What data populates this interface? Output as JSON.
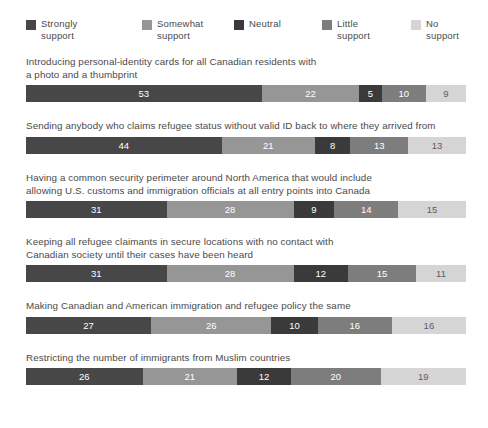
{
  "legend": {
    "items": [
      {
        "label": "Strongly\nsupport",
        "color": "#474747",
        "key": "strongly_support"
      },
      {
        "label": "Somewhat\nsupport",
        "color": "#969696",
        "key": "somewhat_support"
      },
      {
        "label": "Neutral",
        "color": "#3a3a3a",
        "key": "neutral"
      },
      {
        "label": "Little\nsupport",
        "color": "#7d7d7d",
        "key": "little_support"
      },
      {
        "label": "No support",
        "color": "#d5d5d5",
        "key": "no_support"
      }
    ]
  },
  "chart_data": {
    "type": "bar",
    "subtype": "stacked-horizontal-100pct",
    "title": "",
    "xlabel": "",
    "ylabel": "",
    "xlim": [
      0,
      100
    ],
    "grid": false,
    "legend_position": "top",
    "value_unit": "percent",
    "categories": [
      "Introducing personal-identity cards for all Canadian residents with\na photo and a thumbprint",
      "Sending anybody who claims refugee status without valid ID back to where they arrived from",
      "Having a common security perimeter around North America that would include\nallowing U.S. customs and immigration officials at all entry points into Canada",
      "Keeping all refugee claimants in secure locations with no contact with\nCanadian society until their cases have been heard",
      "Making Canadian and American immigration and refugee policy the same",
      "Restricting the number of immigrants from Muslim countries"
    ],
    "series": [
      {
        "name": "Strongly support",
        "color": "#474747",
        "values": [
          53,
          44,
          31,
          31,
          27,
          26
        ]
      },
      {
        "name": "Somewhat support",
        "color": "#969696",
        "values": [
          22,
          21,
          28,
          28,
          26,
          21
        ]
      },
      {
        "name": "Neutral",
        "color": "#3a3a3a",
        "values": [
          5,
          8,
          9,
          12,
          10,
          12
        ]
      },
      {
        "name": "Little support",
        "color": "#7d7d7d",
        "values": [
          10,
          13,
          14,
          15,
          16,
          20
        ]
      },
      {
        "name": "No support",
        "color": "#d5d5d5",
        "values": [
          9,
          13,
          15,
          11,
          16,
          19
        ]
      }
    ]
  },
  "rows": [
    {
      "title": "Introducing personal-identity cards for all Canadian residents with\na photo and a thumbprint",
      "segments": [
        {
          "value": "53",
          "color": "#474747",
          "text": "light"
        },
        {
          "value": "22",
          "color": "#969696",
          "text": "light"
        },
        {
          "value": "5",
          "color": "#3a3a3a",
          "text": "light"
        },
        {
          "value": "10",
          "color": "#7d7d7d",
          "text": "light"
        },
        {
          "value": "9",
          "color": "#d5d5d5",
          "text": "dark"
        }
      ]
    },
    {
      "title": "Sending anybody who claims refugee status without valid ID back to where they arrived from",
      "segments": [
        {
          "value": "44",
          "color": "#474747",
          "text": "light"
        },
        {
          "value": "21",
          "color": "#969696",
          "text": "light"
        },
        {
          "value": "8",
          "color": "#3a3a3a",
          "text": "light"
        },
        {
          "value": "13",
          "color": "#7d7d7d",
          "text": "light"
        },
        {
          "value": "13",
          "color": "#d5d5d5",
          "text": "dark"
        }
      ]
    },
    {
      "title": "Having a common security perimeter around North America that would include\nallowing U.S. customs and immigration officials at all entry points into Canada",
      "segments": [
        {
          "value": "31",
          "color": "#474747",
          "text": "light"
        },
        {
          "value": "28",
          "color": "#969696",
          "text": "light"
        },
        {
          "value": "9",
          "color": "#3a3a3a",
          "text": "light"
        },
        {
          "value": "14",
          "color": "#7d7d7d",
          "text": "light"
        },
        {
          "value": "15",
          "color": "#d5d5d5",
          "text": "dark"
        }
      ]
    },
    {
      "title": "Keeping all refugee claimants in secure locations with no contact with\nCanadian society until their cases have been heard",
      "segments": [
        {
          "value": "31",
          "color": "#474747",
          "text": "light"
        },
        {
          "value": "28",
          "color": "#969696",
          "text": "light"
        },
        {
          "value": "12",
          "color": "#3a3a3a",
          "text": "light"
        },
        {
          "value": "15",
          "color": "#7d7d7d",
          "text": "light"
        },
        {
          "value": "11",
          "color": "#d5d5d5",
          "text": "dark"
        }
      ]
    },
    {
      "title": "Making Canadian and American immigration and refugee policy the same",
      "segments": [
        {
          "value": "27",
          "color": "#474747",
          "text": "light"
        },
        {
          "value": "26",
          "color": "#969696",
          "text": "light"
        },
        {
          "value": "10",
          "color": "#3a3a3a",
          "text": "light"
        },
        {
          "value": "16",
          "color": "#7d7d7d",
          "text": "light"
        },
        {
          "value": "16",
          "color": "#d5d5d5",
          "text": "dark"
        }
      ]
    },
    {
      "title": "Restricting the number of immigrants from Muslim countries",
      "segments": [
        {
          "value": "26",
          "color": "#474747",
          "text": "light"
        },
        {
          "value": "21",
          "color": "#969696",
          "text": "light"
        },
        {
          "value": "12",
          "color": "#3a3a3a",
          "text": "light"
        },
        {
          "value": "20",
          "color": "#7d7d7d",
          "text": "light"
        },
        {
          "value": "19",
          "color": "#d5d5d5",
          "text": "dark"
        }
      ]
    }
  ]
}
